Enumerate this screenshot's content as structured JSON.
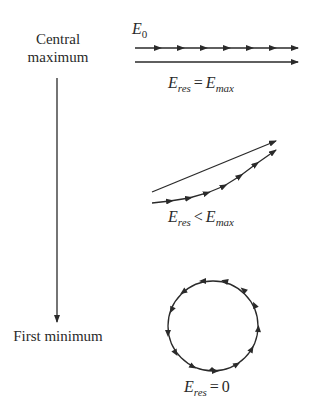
{
  "diagram": {
    "left_labels": {
      "top": "Central maximum",
      "top_line1": "Central",
      "top_line2": "maximum",
      "bottom": "First minimum"
    },
    "phasor_label": {
      "symbol": "E",
      "subscript": "0"
    },
    "states": [
      {
        "name": "central-maximum",
        "lhs": "E",
        "lhs_sub": "res",
        "op": "=",
        "rhs": "E",
        "rhs_sub": "max",
        "shape": "straight-line"
      },
      {
        "name": "intermediate",
        "lhs": "E",
        "lhs_sub": "res",
        "op": "<",
        "rhs": "E",
        "rhs_sub": "max",
        "shape": "arc"
      },
      {
        "name": "first-minimum",
        "lhs": "E",
        "lhs_sub": "res",
        "op": "=",
        "rhs": "0",
        "rhs_sub": "",
        "shape": "closed-circle"
      }
    ],
    "colors": {
      "stroke": "#2a2a2a",
      "background": "#ffffff"
    }
  }
}
